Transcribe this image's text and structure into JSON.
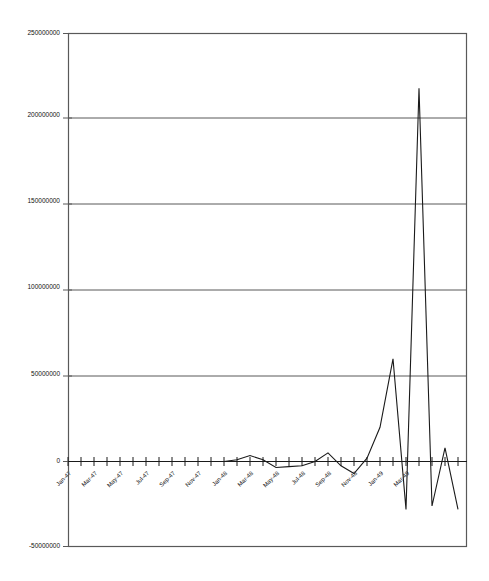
{
  "chart_data": {
    "type": "line",
    "title": "",
    "xlabel": "",
    "ylabel": "",
    "ylim": [
      -50000000,
      250000000
    ],
    "ytick_labels": [
      "250000000",
      "200000000",
      "150000000",
      "100000000",
      "50000000",
      "0",
      "-50000000"
    ],
    "yticks": [
      250000000,
      200000000,
      150000000,
      100000000,
      50000000,
      0,
      -50000000
    ],
    "grid": "horizontal",
    "legend": "none",
    "line_color": "#1a1a1a",
    "axis_color": "#595959",
    "xtick_labels": [
      "Jan-47",
      "Mar-47",
      "May-47",
      "Jul-47",
      "Sep-47",
      "Nov-47",
      "Jan-48",
      "Mar-48",
      "May-48",
      "Jul-48",
      "Sep-48",
      "Nov-48",
      "Jan-49",
      "Mar-49"
    ],
    "categories": [
      "Jan-47",
      "Feb-47",
      "Mar-47",
      "Apr-47",
      "May-47",
      "Jun-47",
      "Jul-47",
      "Aug-47",
      "Sep-47",
      "Oct-47",
      "Nov-47",
      "Dec-47",
      "Jan-48",
      "Feb-48",
      "Mar-48",
      "Apr-48",
      "May-48",
      "Jun-48",
      "Jul-48",
      "Aug-48",
      "Sep-48",
      "Oct-48",
      "Nov-48",
      "Dec-48",
      "Jan-49",
      "Feb-49",
      "Mar-49",
      "Apr-49",
      "May-49",
      "Jun-49",
      "Jul-49"
    ],
    "values": [
      0,
      0,
      0,
      0,
      0,
      0,
      0,
      0,
      0,
      0,
      0,
      0,
      0,
      1000000,
      3500000,
      1000000,
      -3500000,
      -3000000,
      -2500000,
      0,
      5000000,
      -2500000,
      -7000000,
      2000000,
      20000000,
      60000000,
      -28000000,
      218000000,
      -26000000,
      8000000,
      -28000000
    ]
  }
}
